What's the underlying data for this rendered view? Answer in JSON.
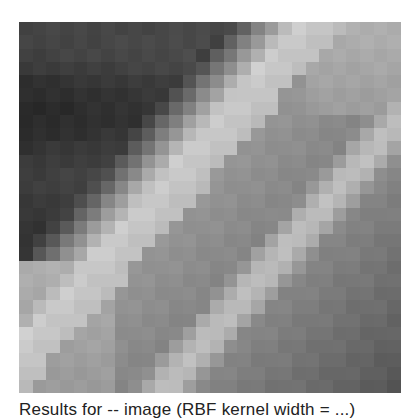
{
  "figure": {
    "type": "grayscale-heatmap",
    "grid_cols": 28,
    "grid_rows": 28,
    "colors": {
      "darkest": "#2e2e2e",
      "dark": "#4a4a4a",
      "mid": "#8f8f8f",
      "light": "#c8c8c8",
      "brightest": "#dadada"
    }
  },
  "caption": "Results for -- image (RBF kernel width = ...)"
}
